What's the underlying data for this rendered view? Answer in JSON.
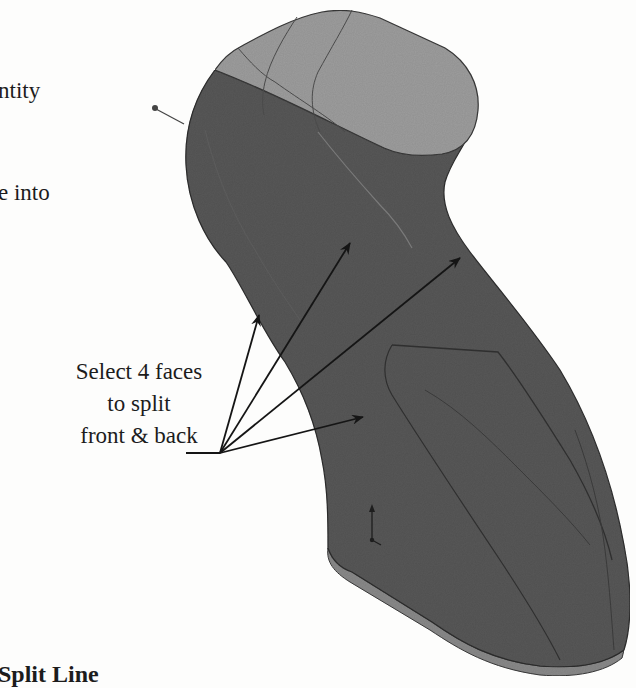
{
  "intro_text": {
    "lines": [
      "ntity",
      "e into"
    ]
  },
  "callout": {
    "lines": [
      "Select 4 faces",
      "to split",
      "front & back"
    ]
  },
  "section_heading": "Split Line",
  "figure": {
    "colors": {
      "body_face": "#5a5a5a",
      "top_face": "#9c9c9c",
      "bottom_band": "#8a8a8a",
      "edge_line": "#3a3a3a",
      "arrow": "#151515"
    },
    "leader": {
      "origin": [
        220,
        453
      ],
      "tail_start": [
        186,
        453
      ],
      "arrow_tips": [
        [
          259,
          315
        ],
        [
          350,
          243
        ],
        [
          460,
          258
        ],
        [
          363,
          417
        ]
      ]
    },
    "triad_icon": "coordinate-triad-icon",
    "origin_marker_icon": "pin-dot-icon"
  }
}
